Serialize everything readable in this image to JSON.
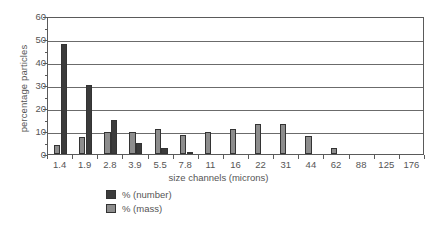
{
  "chart_data": {
    "type": "bar",
    "title": "",
    "xlabel": "size channels (microns)",
    "ylabel": "percentage particles",
    "categories": [
      "1.4",
      "1.9",
      "2.8",
      "3.9",
      "5.5",
      "7.8",
      "11",
      "16",
      "22",
      "31",
      "44",
      "62",
      "88",
      "125",
      "176"
    ],
    "series": [
      {
        "name": "% (number)",
        "color": "#3b3b3b",
        "values": [
          48,
          30,
          15,
          5,
          2.5,
          1,
          0,
          0,
          0,
          0,
          0,
          0,
          0,
          0,
          0
        ]
      },
      {
        "name": "% (mass)",
        "color": "#8d8d8d",
        "values": [
          4,
          7.5,
          9.5,
          9.5,
          10.7,
          8.2,
          9.6,
          10.7,
          13,
          13,
          8,
          2.5,
          0,
          0,
          0
        ]
      }
    ],
    "ylim": [
      0,
      60
    ],
    "yticks": [
      0,
      10,
      20,
      30,
      40,
      50,
      60
    ],
    "ytick_labels": [
      "0",
      "10",
      "20",
      "30",
      "40",
      "50",
      "60"
    ],
    "yminor_step": 5,
    "grid": "horizontal",
    "legend_position": "bottom-center"
  },
  "legend": {
    "items": [
      {
        "label": "% (number)",
        "swatch": "dark-swatch-icon"
      },
      {
        "label": "% (mass)",
        "swatch": "gray-swatch-icon"
      }
    ]
  }
}
